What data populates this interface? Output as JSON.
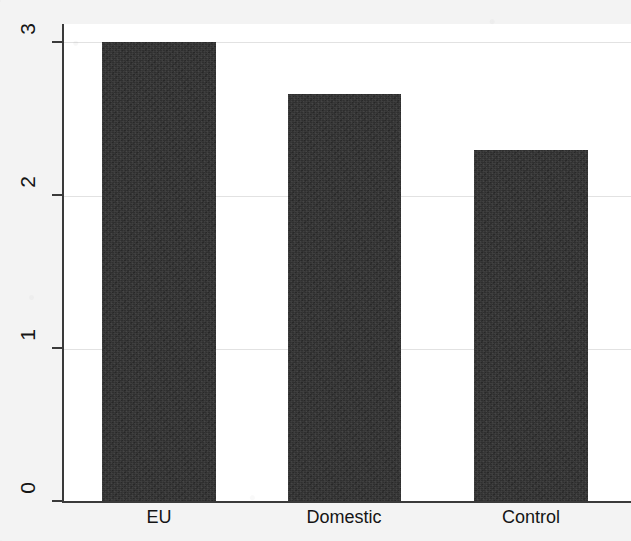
{
  "chart_data": {
    "type": "bar",
    "title": "",
    "subtitle": "",
    "xlabel": "",
    "ylabel": "",
    "categories": [
      "EU",
      "Domestic",
      "Control"
    ],
    "values": [
      3.0,
      2.66,
      2.3
    ],
    "series": [
      {
        "name": "mean",
        "values": [
          3.0,
          2.66,
          2.3
        ]
      }
    ],
    "ylim": [
      0,
      3.12
    ],
    "xlim": [
      0,
      3
    ],
    "y_ticks": [
      0,
      1,
      2,
      3
    ],
    "y_tick_labels": [
      "0",
      "1",
      "2",
      "3"
    ],
    "x_tick_labels": [
      "EU",
      "Domestic",
      "Control"
    ],
    "grid": "horizontal",
    "gridlines_at": [
      1,
      2,
      3
    ],
    "legend": null,
    "legend_position": "none",
    "annotations": [],
    "bar_color": "#2f2f2f",
    "plot_background": "#ffffff",
    "figure_background": "#f3f3f3",
    "axis_color": "#3a3a3a",
    "grid_color": "#e2e2e2",
    "y_tick_label_rotation": 90
  },
  "axes": {
    "y": {
      "ticks": [
        {
          "label": "3",
          "value": 3
        },
        {
          "label": "2",
          "value": 2
        },
        {
          "label": "1",
          "value": 1
        },
        {
          "label": "0",
          "value": 0
        }
      ]
    },
    "x": {
      "ticks": [
        {
          "label": "EU"
        },
        {
          "label": "Domestic"
        },
        {
          "label": "Control"
        }
      ]
    }
  },
  "bars": [
    {
      "category": "EU",
      "value": 3.0
    },
    {
      "category": "Domestic",
      "value": 2.66
    },
    {
      "category": "Control",
      "value": 2.3
    }
  ]
}
